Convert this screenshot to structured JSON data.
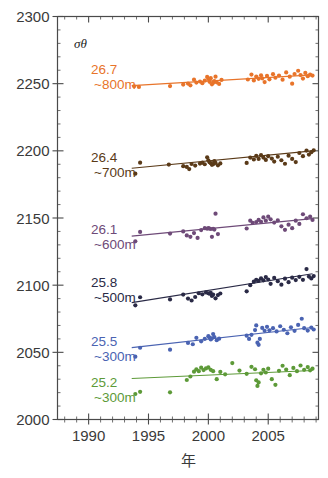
{
  "chart_data": {
    "type": "scatter",
    "title": "",
    "xlabel": "年",
    "ylabel": "",
    "xlim": [
      1987.4,
      2009.2
    ],
    "ylim": [
      2000,
      2300
    ],
    "xticks": [
      1990,
      1995,
      2000,
      2005
    ],
    "xtick_labels": [
      "1990",
      "1995",
      "2000",
      "2005"
    ],
    "xminor_step": 1,
    "yticks": [
      2000,
      2050,
      2100,
      2150,
      2200,
      2250,
      2300
    ],
    "ytick_labels": [
      "2000",
      "2050",
      "2100",
      "2150",
      "2200",
      "2250",
      "2300"
    ],
    "yminor_step": 10,
    "grid": false,
    "legend_position": "inside-left",
    "legend_header": "σθ",
    "series": [
      {
        "name": "26.7 ~800m",
        "sigma": "26.7",
        "depth": "~800m",
        "color": "#E8742A",
        "label_x": 1990.2,
        "label_y": 2257,
        "trend": {
          "x0": 1993.6,
          "y0": 2248.5,
          "x1": 2008.7,
          "y1": 2256.5
        },
        "points": [
          [
            1993.8,
            2248.0
          ],
          [
            1994.2,
            2247.6
          ],
          [
            1996.8,
            2248.2
          ],
          [
            1997.9,
            2249.3
          ],
          [
            1998.3,
            2250.1
          ],
          [
            1998.5,
            2248.8
          ],
          [
            1998.8,
            2253.0
          ],
          [
            1999.0,
            2250.8
          ],
          [
            1999.3,
            2251.6
          ],
          [
            1999.5,
            2250.3
          ],
          [
            1999.7,
            2252.2
          ],
          [
            1999.9,
            2255.0
          ],
          [
            2000.0,
            2253.5
          ],
          [
            2000.1,
            2251.4
          ],
          [
            2000.2,
            2254.1
          ],
          [
            2000.3,
            2249.5
          ],
          [
            2000.4,
            2250.6
          ],
          [
            2000.5,
            2252.0
          ],
          [
            2000.6,
            2255.2
          ],
          [
            2000.7,
            2251.0
          ],
          [
            2000.9,
            2249.8
          ],
          [
            2001.1,
            2252.8
          ],
          [
            2003.3,
            2253.1
          ],
          [
            2003.6,
            2256.8
          ],
          [
            2003.8,
            2252.4
          ],
          [
            2004.0,
            2255.3
          ],
          [
            2004.2,
            2253.6
          ],
          [
            2004.4,
            2256.2
          ],
          [
            2004.5,
            2254.0
          ],
          [
            2004.7,
            2251.2
          ],
          [
            2004.9,
            2255.8
          ],
          [
            2005.1,
            2253.2
          ],
          [
            2005.4,
            2257.1
          ],
          [
            2005.6,
            2254.4
          ],
          [
            2005.9,
            2256.0
          ],
          [
            2006.2,
            2253.0
          ],
          [
            2006.5,
            2258.4
          ],
          [
            2006.8,
            2255.2
          ],
          [
            2007.0,
            2250.0
          ],
          [
            2007.2,
            2257.2
          ],
          [
            2007.5,
            2259.6
          ],
          [
            2007.7,
            2256.4
          ],
          [
            2007.9,
            2253.8
          ],
          [
            2008.1,
            2258.0
          ],
          [
            2008.3,
            2255.6
          ],
          [
            2008.5,
            2256.8
          ],
          [
            2008.7,
            2256.0
          ]
        ]
      },
      {
        "name": "26.4 ~700m",
        "sigma": "26.4",
        "depth": "~700m",
        "color": "#5A3A18",
        "label_x": 1990.2,
        "label_y": 2192,
        "trend": {
          "x0": 1993.6,
          "y0": 2187.0,
          "x1": 2008.7,
          "y1": 2200.0
        },
        "points": [
          [
            1993.9,
            2183.0
          ],
          [
            1994.3,
            2191.2
          ],
          [
            1996.7,
            2189.8
          ],
          [
            1997.9,
            2188.6
          ],
          [
            1998.2,
            2188.0
          ],
          [
            1998.4,
            2186.4
          ],
          [
            1998.6,
            2190.2
          ],
          [
            1998.9,
            2189.0
          ],
          [
            1999.3,
            2190.5
          ],
          [
            1999.5,
            2191.2
          ],
          [
            1999.7,
            2190.0
          ],
          [
            1999.9,
            2195.2
          ],
          [
            2000.0,
            2193.0
          ],
          [
            2000.1,
            2191.5
          ],
          [
            2000.2,
            2190.8
          ],
          [
            2000.3,
            2189.6
          ],
          [
            2000.4,
            2190.1
          ],
          [
            2000.5,
            2192.3
          ],
          [
            2000.6,
            2191.0
          ],
          [
            2000.8,
            2189.2
          ],
          [
            2001.0,
            2190.6
          ],
          [
            2003.2,
            2191.0
          ],
          [
            2003.5,
            2195.0
          ],
          [
            2003.8,
            2193.6
          ],
          [
            2004.0,
            2196.2
          ],
          [
            2004.2,
            2194.0
          ],
          [
            2004.4,
            2196.8
          ],
          [
            2004.6,
            2195.0
          ],
          [
            2004.8,
            2193.2
          ],
          [
            2005.0,
            2196.0
          ],
          [
            2005.3,
            2194.2
          ],
          [
            2005.5,
            2192.0
          ],
          [
            2005.8,
            2195.6
          ],
          [
            2006.1,
            2193.0
          ],
          [
            2006.4,
            2190.4
          ],
          [
            2006.7,
            2196.4
          ],
          [
            2007.0,
            2194.0
          ],
          [
            2007.3,
            2191.6
          ],
          [
            2007.6,
            2198.4
          ],
          [
            2007.9,
            2196.0
          ],
          [
            2008.2,
            2200.2
          ],
          [
            2008.4,
            2197.2
          ],
          [
            2008.6,
            2199.0
          ],
          [
            2008.8,
            2200.4
          ]
        ]
      },
      {
        "name": "26.1 ~600m",
        "sigma": "26.1",
        "depth": "~600m",
        "color": "#6E4A78",
        "label_x": 1990.2,
        "label_y": 2138,
        "trend": {
          "x0": 1993.6,
          "y0": 2136.5,
          "x1": 2008.7,
          "y1": 2149.5
        },
        "points": [
          [
            1993.9,
            2132.6
          ],
          [
            1994.3,
            2139.6
          ],
          [
            1996.8,
            2138.4
          ],
          [
            1997.9,
            2140.0
          ],
          [
            1998.2,
            2137.0
          ],
          [
            1998.5,
            2136.0
          ],
          [
            1998.8,
            2138.8
          ],
          [
            1999.1,
            2135.2
          ],
          [
            1999.4,
            2141.0
          ],
          [
            1999.7,
            2142.4
          ],
          [
            1999.9,
            2142.0
          ],
          [
            2000.0,
            2142.5
          ],
          [
            2000.1,
            2142.2
          ],
          [
            2000.2,
            2141.8
          ],
          [
            2000.3,
            2136.0
          ],
          [
            2000.4,
            2142.0
          ],
          [
            2000.5,
            2141.4
          ],
          [
            2000.6,
            2153.2
          ],
          [
            2000.8,
            2138.0
          ],
          [
            2003.2,
            2142.2
          ],
          [
            2003.5,
            2148.0
          ],
          [
            2003.7,
            2146.4
          ],
          [
            2004.0,
            2147.0
          ],
          [
            2004.2,
            2148.6
          ],
          [
            2004.4,
            2147.2
          ],
          [
            2004.6,
            2150.4
          ],
          [
            2004.8,
            2148.0
          ],
          [
            2005.0,
            2151.0
          ],
          [
            2005.2,
            2149.0
          ],
          [
            2005.5,
            2146.6
          ],
          [
            2005.8,
            2148.2
          ],
          [
            2006.1,
            2143.8
          ],
          [
            2006.4,
            2141.2
          ],
          [
            2006.7,
            2145.0
          ],
          [
            2007.0,
            2142.4
          ],
          [
            2007.3,
            2148.0
          ],
          [
            2007.6,
            2145.6
          ],
          [
            2007.9,
            2152.8
          ],
          [
            2008.2,
            2149.8
          ],
          [
            2008.5,
            2151.0
          ],
          [
            2008.7,
            2148.6
          ]
        ]
      },
      {
        "name": "25.8 ~500m",
        "sigma": "25.8",
        "depth": "~500m",
        "color": "#2A2A46",
        "label_x": 1990.2,
        "label_y": 2099,
        "trend": {
          "x0": 1993.6,
          "y0": 2087.0,
          "x1": 2008.7,
          "y1": 2108.5
        },
        "points": [
          [
            1993.9,
            2085.0
          ],
          [
            1994.3,
            2091.0
          ],
          [
            1996.8,
            2089.4
          ],
          [
            1997.9,
            2093.0
          ],
          [
            1998.3,
            2090.0
          ],
          [
            1998.6,
            2088.6
          ],
          [
            1998.9,
            2091.2
          ],
          [
            1999.2,
            2094.0
          ],
          [
            1999.5,
            2093.2
          ],
          [
            1999.8,
            2094.6
          ],
          [
            2000.0,
            2094.0
          ],
          [
            2000.1,
            2093.6
          ],
          [
            2000.2,
            2094.2
          ],
          [
            2000.3,
            2092.0
          ],
          [
            2000.4,
            2093.0
          ],
          [
            2000.6,
            2090.2
          ],
          [
            2000.8,
            2092.6
          ],
          [
            2001.0,
            2093.8
          ],
          [
            2003.2,
            2095.4
          ],
          [
            2003.5,
            2100.0
          ],
          [
            2003.8,
            2102.6
          ],
          [
            2004.0,
            2104.0
          ],
          [
            2004.2,
            2103.2
          ],
          [
            2004.4,
            2105.0
          ],
          [
            2004.6,
            2103.6
          ],
          [
            2004.8,
            2106.0
          ],
          [
            2005.0,
            2104.2
          ],
          [
            2005.2,
            2101.0
          ],
          [
            2005.5,
            2105.4
          ],
          [
            2005.8,
            2103.0
          ],
          [
            2006.1,
            2100.4
          ],
          [
            2006.4,
            2104.8
          ],
          [
            2006.7,
            2102.2
          ],
          [
            2007.0,
            2105.6
          ],
          [
            2007.3,
            2103.8
          ],
          [
            2007.6,
            2106.2
          ],
          [
            2007.9,
            2104.0
          ],
          [
            2008.2,
            2112.0
          ],
          [
            2008.4,
            2106.4
          ],
          [
            2008.6,
            2105.0
          ],
          [
            2008.8,
            2106.8
          ]
        ]
      },
      {
        "name": "25.5 ~300m",
        "sigma": "25.5",
        "depth": "~300m",
        "color": "#4A63B2",
        "label_x": 1990.2,
        "label_y": 2055,
        "trend": {
          "x0": 1993.6,
          "y0": 2053.5,
          "x1": 2008.7,
          "y1": 2068.5
        },
        "points": [
          [
            1993.9,
            2046.8
          ],
          [
            1994.3,
            2053.4
          ],
          [
            1996.8,
            2052.0
          ],
          [
            1998.3,
            2057.0
          ],
          [
            1998.7,
            2056.0
          ],
          [
            1999.0,
            2060.8
          ],
          [
            1999.4,
            2058.2
          ],
          [
            1999.7,
            2060.0
          ],
          [
            2000.0,
            2062.0
          ],
          [
            2000.1,
            2061.0
          ],
          [
            2000.2,
            2059.6
          ],
          [
            2000.3,
            2060.4
          ],
          [
            2000.4,
            2063.6
          ],
          [
            2000.5,
            2061.4
          ],
          [
            2000.7,
            2059.0
          ],
          [
            2000.9,
            2060.2
          ],
          [
            2003.2,
            2062.4
          ],
          [
            2003.4,
            2060.0
          ],
          [
            2003.6,
            2063.0
          ],
          [
            2003.9,
            2066.6
          ],
          [
            2004.0,
            2070.0
          ],
          [
            2004.1,
            2057.2
          ],
          [
            2004.2,
            2055.6
          ],
          [
            2004.3,
            2060.0
          ],
          [
            2004.5,
            2068.2
          ],
          [
            2004.7,
            2066.0
          ],
          [
            2004.9,
            2069.0
          ],
          [
            2005.1,
            2066.4
          ],
          [
            2005.4,
            2068.0
          ],
          [
            2005.7,
            2065.6
          ],
          [
            2006.0,
            2069.4
          ],
          [
            2006.3,
            2066.8
          ],
          [
            2006.6,
            2064.2
          ],
          [
            2006.9,
            2068.6
          ],
          [
            2007.2,
            2066.0
          ],
          [
            2007.5,
            2070.4
          ],
          [
            2007.8,
            2075.0
          ],
          [
            2008.0,
            2068.0
          ],
          [
            2008.3,
            2066.2
          ],
          [
            2008.6,
            2068.4
          ],
          [
            2008.8,
            2067.0
          ]
        ]
      },
      {
        "name": "25.2 ~300m",
        "sigma": "25.2",
        "depth": "~300m",
        "color": "#5D9A38",
        "label_x": 1990.2,
        "label_y": 2024,
        "trend": {
          "x0": 1993.6,
          "y0": 2030.5,
          "x1": 2008.7,
          "y1": 2036.5
        },
        "points": [
          [
            1993.9,
            2019.0
          ],
          [
            1994.3,
            2020.6
          ],
          [
            1996.8,
            2020.2
          ],
          [
            1998.2,
            2029.4
          ],
          [
            1998.5,
            2032.0
          ],
          [
            1998.8,
            2035.6
          ],
          [
            1999.0,
            2037.4
          ],
          [
            1999.2,
            2036.0
          ],
          [
            1999.4,
            2038.6
          ],
          [
            1999.6,
            2036.8
          ],
          [
            1999.8,
            2038.0
          ],
          [
            2000.0,
            2038.8
          ],
          [
            2000.2,
            2037.0
          ],
          [
            2000.4,
            2036.0
          ],
          [
            2000.7,
            2030.0
          ],
          [
            2001.0,
            2035.4
          ],
          [
            2001.4,
            2033.6
          ],
          [
            2002.0,
            2042.0
          ],
          [
            2002.6,
            2036.4
          ],
          [
            2003.2,
            2034.0
          ],
          [
            2003.6,
            2039.2
          ],
          [
            2003.9,
            2037.4
          ],
          [
            2004.0,
            2029.2
          ],
          [
            2004.1,
            2025.0
          ],
          [
            2004.2,
            2027.6
          ],
          [
            2004.4,
            2034.4
          ],
          [
            2004.6,
            2037.0
          ],
          [
            2004.8,
            2035.0
          ],
          [
            2005.0,
            2037.8
          ],
          [
            2005.3,
            2030.0
          ],
          [
            2005.6,
            2025.8
          ],
          [
            2005.9,
            2036.2
          ],
          [
            2006.2,
            2040.0
          ],
          [
            2006.5,
            2037.2
          ],
          [
            2006.8,
            2033.0
          ],
          [
            2007.1,
            2038.4
          ],
          [
            2007.4,
            2036.0
          ],
          [
            2007.7,
            2040.2
          ],
          [
            2008.0,
            2037.0
          ],
          [
            2008.3,
            2039.0
          ],
          [
            2008.5,
            2036.6
          ],
          [
            2008.7,
            2037.8
          ]
        ]
      }
    ]
  }
}
